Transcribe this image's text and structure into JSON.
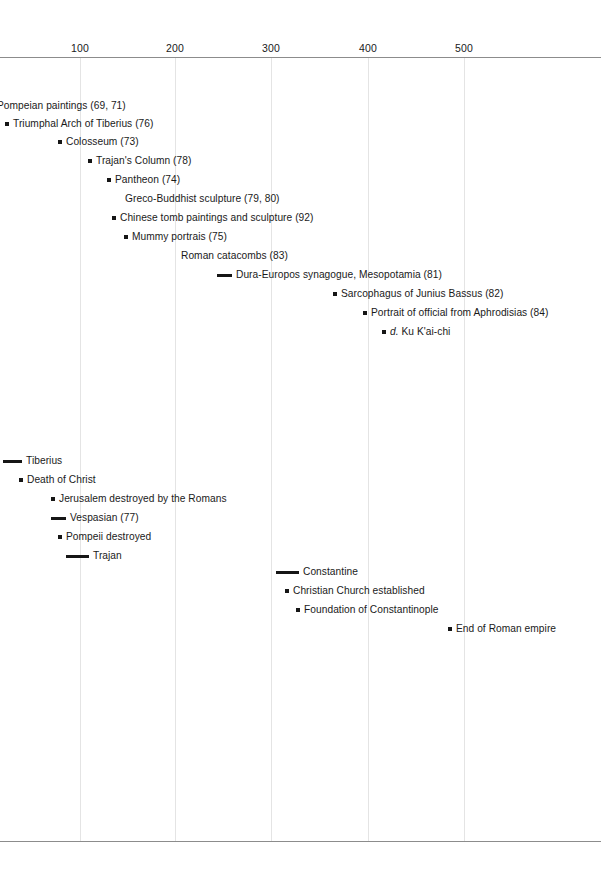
{
  "chart_data": {
    "type": "timeline",
    "title": "",
    "xlabel": "",
    "ylabel": "",
    "xlim": [
      -16,
      601
    ],
    "axis": {
      "ticks": [
        {
          "label": "100",
          "value": 100,
          "x": 80
        },
        {
          "label": "200",
          "value": 200,
          "x": 175
        },
        {
          "label": "300",
          "value": 300,
          "x": 271
        },
        {
          "label": "400",
          "value": 400,
          "x": 368
        },
        {
          "label": "500",
          "value": 500,
          "x": 464
        }
      ],
      "grid": true,
      "grid_color": "#e4e4e4",
      "line_color": "#8c8c8c"
    },
    "groups": [
      {
        "name": "artworks",
        "entries": [
          {
            "label": "Pompeian paintings (69, 71)",
            "marker": "none",
            "marker_x": 0,
            "marker_w": 0,
            "text_x": -3,
            "y": 106
          },
          {
            "label": "Triumphal Arch of Tiberius (76)",
            "marker": "dot",
            "marker_x": 5,
            "marker_w": 4,
            "text_x": 13,
            "y": 124
          },
          {
            "label": "Colosseum (73)",
            "marker": "dot",
            "marker_x": 58,
            "marker_w": 4,
            "text_x": 66,
            "y": 142
          },
          {
            "label": "Trajan's Column (78)",
            "marker": "dot",
            "marker_x": 88,
            "marker_w": 4,
            "text_x": 96,
            "y": 161
          },
          {
            "label": "Pantheon (74)",
            "marker": "dot",
            "marker_x": 107,
            "marker_w": 4,
            "text_x": 115,
            "y": 180
          },
          {
            "label": "Greco-Buddhist sculpture (79, 80)",
            "marker": "none",
            "marker_x": 0,
            "marker_w": 0,
            "text_x": 125,
            "y": 199
          },
          {
            "label": "Chinese tomb paintings and sculpture (92)",
            "marker": "dot",
            "marker_x": 112,
            "marker_w": 4,
            "text_x": 120,
            "y": 218
          },
          {
            "label": "Mummy portrais (75)",
            "marker": "dot",
            "marker_x": 124,
            "marker_w": 4,
            "text_x": 132,
            "y": 237
          },
          {
            "label": "Roman catacombs (83)",
            "marker": "none",
            "marker_x": 0,
            "marker_w": 0,
            "text_x": 181,
            "y": 256
          },
          {
            "label": "Dura-Europos synagogue, Mesopotamia (81)",
            "marker": "bar",
            "marker_x": 217,
            "marker_w": 15,
            "text_x": 236,
            "y": 275
          },
          {
            "label": "Sarcophagus of Junius Bassus (82)",
            "marker": "dot",
            "marker_x": 333,
            "marker_w": 4,
            "text_x": 341,
            "y": 294
          },
          {
            "label": "Portrait of official from Aphrodisias (84)",
            "marker": "dot",
            "marker_x": 363,
            "marker_w": 4,
            "text_x": 371,
            "y": 313
          },
          {
            "label": "d. Ku K'ai-chi",
            "marker": "dot",
            "italic_prefix": "d.",
            "marker_x": 382,
            "marker_w": 4,
            "text_x": 390,
            "y": 332
          }
        ]
      },
      {
        "name": "events",
        "entries": [
          {
            "label": "Tiberius",
            "marker": "bar",
            "marker_x": 3,
            "marker_w": 19,
            "text_x": 26,
            "y": 461
          },
          {
            "label": "Death of Christ",
            "marker": "dot",
            "marker_x": 19,
            "marker_w": 4,
            "text_x": 27,
            "y": 480
          },
          {
            "label": "Jerusalem destroyed by the Romans",
            "marker": "dot",
            "marker_x": 51,
            "marker_w": 4,
            "text_x": 59,
            "y": 499
          },
          {
            "label": "Vespasian (77)",
            "marker": "bar",
            "marker_x": 51,
            "marker_w": 15,
            "text_x": 70,
            "y": 518
          },
          {
            "label": "Pompeii destroyed",
            "marker": "dot",
            "marker_x": 58,
            "marker_w": 4,
            "text_x": 66,
            "y": 537
          },
          {
            "label": "Trajan",
            "marker": "bar",
            "marker_x": 66,
            "marker_w": 23,
            "text_x": 93,
            "y": 556
          },
          {
            "label": "Constantine",
            "marker": "bar",
            "marker_x": 276,
            "marker_w": 23,
            "text_x": 303,
            "y": 572
          },
          {
            "label": "Christian Church established",
            "marker": "dot",
            "marker_x": 285,
            "marker_w": 4,
            "text_x": 293,
            "y": 591
          },
          {
            "label": "Foundation of Constantinople",
            "marker": "dot",
            "marker_x": 296,
            "marker_w": 4,
            "text_x": 304,
            "y": 610
          },
          {
            "label": "End of Roman empire",
            "marker": "dot",
            "marker_x": 448,
            "marker_w": 4,
            "text_x": 456,
            "y": 629
          }
        ]
      }
    ]
  }
}
